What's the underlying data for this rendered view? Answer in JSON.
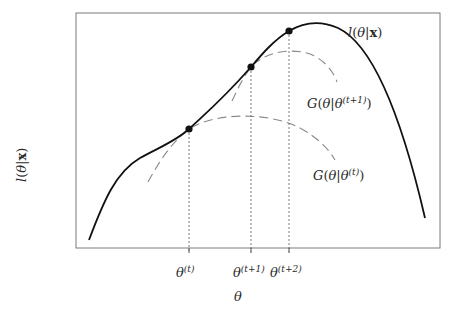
{
  "diagram": {
    "frame": {
      "left": 76,
      "top": 13,
      "right": 440,
      "bottom": 248,
      "stroke": "#7a7a7a"
    },
    "y_axis_label": {
      "func": "l",
      "open": "(",
      "var": "θ",
      "bar": "|",
      "data": "x",
      "close": ")"
    },
    "x_axis_label": "θ",
    "curves": {
      "likelihood": {
        "label_func": "l",
        "label_var": "θ",
        "label_data": "x",
        "stroke": "#111111",
        "style": "solid"
      },
      "surrogate_t": {
        "label_func": "G",
        "label_var": "θ",
        "label_sup": "(t)",
        "stroke": "#8a8a8a",
        "style": "dashed"
      },
      "surrogate_t1": {
        "label_func": "G",
        "label_var": "θ",
        "label_sup": "(t+1)",
        "stroke": "#8a8a8a",
        "style": "dashed"
      }
    },
    "points": [
      {
        "name": "theta-t",
        "x": 189,
        "y": 129,
        "tick_label": "θ",
        "tick_sup": "(t)"
      },
      {
        "name": "theta-t1",
        "x": 251,
        "y": 67,
        "tick_label": "θ",
        "tick_sup": "(t+1)"
      },
      {
        "name": "theta-t2",
        "x": 289,
        "y": 31,
        "tick_label": "θ",
        "tick_sup": "(t+2)"
      }
    ],
    "colors": {
      "curve": "#111111",
      "dashed": "#8a8a8a",
      "frame": "#7a7a7a",
      "guide": "#6a6a6a",
      "text": "#2a2a2a"
    }
  }
}
